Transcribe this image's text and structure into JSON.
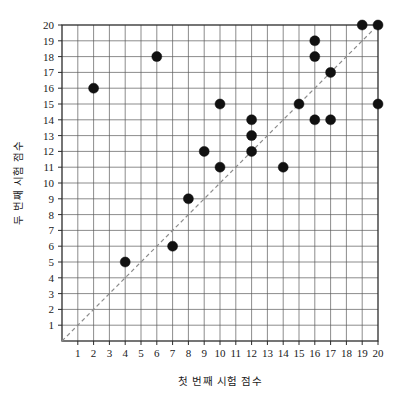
{
  "chart_data": {
    "type": "scatter",
    "title": "",
    "xlabel": "첫 번째 시험 점수",
    "ylabel": "두 번째 시험 점수",
    "xlim": [
      0,
      20
    ],
    "ylim": [
      0,
      20
    ],
    "xticks": [
      1,
      2,
      3,
      4,
      5,
      6,
      7,
      8,
      9,
      10,
      11,
      12,
      13,
      14,
      15,
      16,
      17,
      18,
      19,
      20
    ],
    "yticks": [
      1,
      2,
      3,
      4,
      5,
      6,
      7,
      8,
      9,
      10,
      11,
      12,
      13,
      14,
      15,
      16,
      17,
      18,
      19,
      20
    ],
    "xtick_labels": [
      "1",
      "2",
      "3",
      "4",
      "5",
      "6",
      "7",
      "8",
      "9",
      "10",
      "11",
      "12",
      "13",
      "14",
      "15",
      "16",
      "17",
      "18",
      "19",
      "20"
    ],
    "ytick_labels": [
      "1",
      "2",
      "3",
      "4",
      "5",
      "6",
      "7",
      "8",
      "9",
      "10",
      "11",
      "12",
      "13",
      "14",
      "15",
      "16",
      "17",
      "18",
      "19",
      "20"
    ],
    "grid": true,
    "legend": null,
    "points": [
      {
        "x": 2,
        "y": 16
      },
      {
        "x": 4,
        "y": 5
      },
      {
        "x": 6,
        "y": 18
      },
      {
        "x": 7,
        "y": 6
      },
      {
        "x": 8,
        "y": 9
      },
      {
        "x": 9,
        "y": 12
      },
      {
        "x": 10,
        "y": 11
      },
      {
        "x": 10,
        "y": 15
      },
      {
        "x": 12,
        "y": 12
      },
      {
        "x": 12,
        "y": 13
      },
      {
        "x": 12,
        "y": 14
      },
      {
        "x": 14,
        "y": 11
      },
      {
        "x": 15,
        "y": 15
      },
      {
        "x": 16,
        "y": 14
      },
      {
        "x": 16,
        "y": 18
      },
      {
        "x": 16,
        "y": 19
      },
      {
        "x": 17,
        "y": 14
      },
      {
        "x": 17,
        "y": 17
      },
      {
        "x": 19,
        "y": 20
      },
      {
        "x": 20,
        "y": 15
      },
      {
        "x": 20,
        "y": 20
      }
    ],
    "reference_line": {
      "name": "y = x identity line",
      "style": "dashed",
      "color": "#8b8b8b",
      "from": [
        0,
        0
      ],
      "to": [
        20,
        20
      ]
    },
    "marker": {
      "shape": "filled-circle",
      "color": "#111111",
      "size": 5
    }
  }
}
